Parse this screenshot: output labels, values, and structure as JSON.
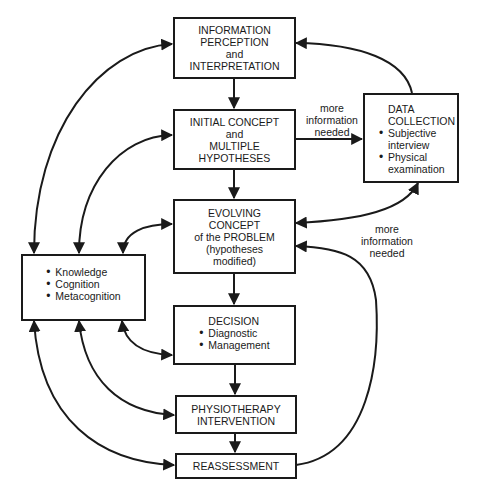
{
  "diagram": {
    "type": "flowchart",
    "nodes": {
      "info": {
        "lines": [
          "INFORMATION",
          "PERCEPTION",
          "and",
          "INTERPRETATION"
        ]
      },
      "initial": {
        "lines": [
          "INITIAL CONCEPT",
          "and",
          "MULTIPLE",
          "HYPOTHESES"
        ]
      },
      "evolving": {
        "lines": [
          "EVOLVING",
          "CONCEPT",
          "of the PROBLEM",
          "(hypotheses",
          "modified)"
        ]
      },
      "decision": {
        "title": "DECISION",
        "bullets": [
          "Diagnostic",
          "Management"
        ]
      },
      "physio": {
        "lines": [
          "PHYSIOTHERAPY",
          "INTERVENTION"
        ]
      },
      "reassessment": {
        "lines": [
          "REASSESSMENT"
        ]
      },
      "data_collection": {
        "title": [
          "DATA",
          "COLLECTION"
        ],
        "bullets": [
          [
            "Subjective",
            "interview"
          ],
          [
            "Physical",
            "examination"
          ]
        ]
      },
      "knowledge": {
        "bullets": [
          "Knowledge",
          "Cognition",
          "Metacognition"
        ]
      }
    },
    "edge_labels": {
      "to_data_collection": [
        "more",
        "information",
        "needed"
      ],
      "from_evolving": [
        "more",
        "information",
        "needed"
      ]
    },
    "edges": [
      {
        "from": "info",
        "to": "initial"
      },
      {
        "from": "initial",
        "to": "evolving"
      },
      {
        "from": "evolving",
        "to": "decision"
      },
      {
        "from": "decision",
        "to": "physio"
      },
      {
        "from": "physio",
        "to": "reassessment"
      },
      {
        "from": "initial",
        "to": "data_collection",
        "label": "more information needed"
      },
      {
        "from": "data_collection",
        "to": "info"
      },
      {
        "from": "evolving",
        "to": "data_collection",
        "label": "more information needed",
        "bidirectional": true
      },
      {
        "from": "reassessment",
        "to": "evolving"
      },
      {
        "from": "knowledge",
        "to": "info",
        "bidirectional": true
      },
      {
        "from": "knowledge",
        "to": "initial",
        "bidirectional": true
      },
      {
        "from": "knowledge",
        "to": "evolving",
        "bidirectional": true
      },
      {
        "from": "knowledge",
        "to": "decision",
        "bidirectional": true
      },
      {
        "from": "knowledge",
        "to": "physio",
        "bidirectional": true
      },
      {
        "from": "knowledge",
        "to": "reassessment",
        "bidirectional": true
      }
    ]
  }
}
